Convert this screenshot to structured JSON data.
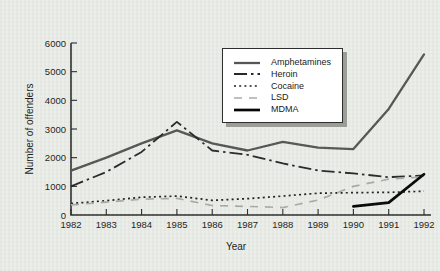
{
  "figure": {
    "background": "#eceee9",
    "axis_color": "#2b2b2b",
    "text_color": "#1b1b1b",
    "legend": {
      "background": "#ffffff",
      "border_color": "#2e2e2e",
      "shadow_color": "#9b9e97"
    }
  },
  "chart_data": {
    "type": "line",
    "title": "",
    "xlabel": "Year",
    "ylabel": "Number of offenders",
    "x": [
      1982,
      1983,
      1984,
      1985,
      1986,
      1987,
      1988,
      1989,
      1990,
      1991,
      1992
    ],
    "ylim": [
      0,
      6000
    ],
    "yticks": [
      0,
      1000,
      2000,
      3000,
      4000,
      5000,
      6000
    ],
    "grid": false,
    "legend_position": "inside upper right",
    "series": [
      {
        "name": "Amphetamines",
        "style": "solid",
        "color": "#545752",
        "width": 2.3,
        "dash": "",
        "values": [
          1550,
          2000,
          2500,
          2950,
          2500,
          2250,
          2550,
          2350,
          2300,
          3700,
          5600
        ]
      },
      {
        "name": "Heroin",
        "style": "dash-dot",
        "color": "#282828",
        "width": 1.8,
        "dash": "13 4 2.5 4",
        "values": [
          1000,
          1500,
          2200,
          3250,
          2250,
          2100,
          1800,
          1550,
          1450,
          1320,
          1380
        ]
      },
      {
        "name": "Cocaine",
        "style": "dotted",
        "color": "#1f1f1f",
        "width": 1.7,
        "dash": "2 3.2",
        "values": [
          400,
          500,
          620,
          660,
          510,
          570,
          660,
          760,
          780,
          790,
          830
        ]
      },
      {
        "name": "LSD",
        "style": "dashed",
        "color": "#a9ada7",
        "width": 1.7,
        "dash": "8 7",
        "values": [
          350,
          450,
          550,
          580,
          330,
          300,
          260,
          520,
          1000,
          1250,
          1330
        ]
      },
      {
        "name": "MDMA",
        "style": "solid",
        "color": "#060606",
        "width": 2.7,
        "dash": "",
        "values": [
          null,
          null,
          null,
          null,
          null,
          null,
          null,
          null,
          300,
          430,
          1420
        ]
      }
    ]
  }
}
